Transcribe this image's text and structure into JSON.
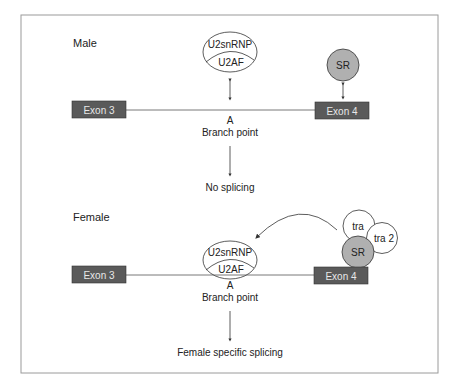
{
  "male": {
    "label": "Male",
    "u2snrnp": "U2snRNP",
    "u2af": "U2AF",
    "sr": "SR",
    "exon3": "Exon 3",
    "exon4": "Exon 4",
    "branch_a": "A",
    "branch_point": "Branch point",
    "outcome": "No splicing"
  },
  "female": {
    "label": "Female",
    "u2snrnp": "U2snRNP",
    "u2af": "U2AF",
    "sr": "SR",
    "tra": "tra",
    "tra2": "tra 2",
    "exon3": "Exon 3",
    "exon4": "Exon 4",
    "branch_a": "A",
    "branch_point": "Branch point",
    "outcome": "Female specific splicing"
  },
  "colors": {
    "exon_fill": "#5a5a5a",
    "exon_text": "#e8e8e8",
    "sr_fill": "#b0b0b0",
    "border": "#9a9a9a",
    "line": "#555555"
  }
}
